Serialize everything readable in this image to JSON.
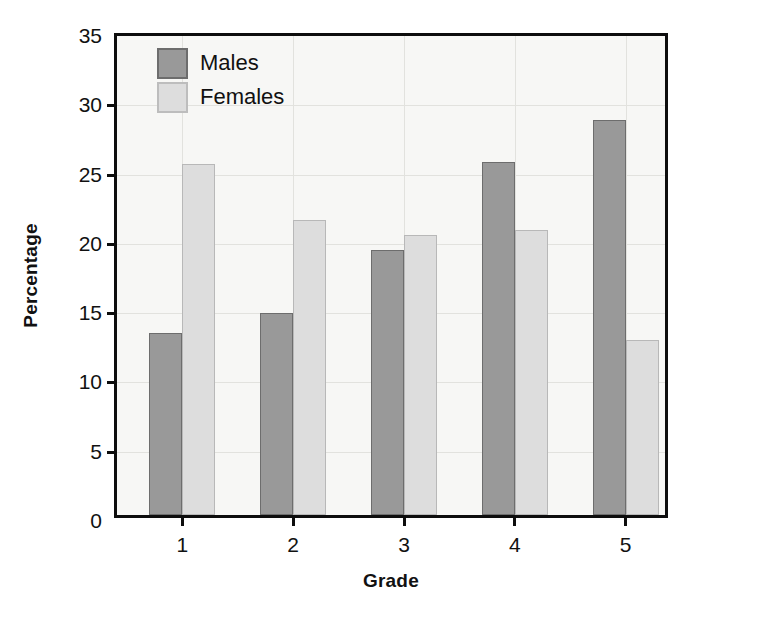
{
  "chart_data": {
    "type": "bar",
    "title": "",
    "xlabel": "Grade",
    "ylabel": "Percentage",
    "categories": [
      "1",
      "2",
      "3",
      "4",
      "5"
    ],
    "series": [
      {
        "name": "Males",
        "color": "#999999",
        "edge": "#6d6d6d",
        "values": [
          13.1,
          14.6,
          19.1,
          25.5,
          28.5
        ]
      },
      {
        "name": "Females",
        "color": "#dddddd",
        "edge": "#b8b8b8",
        "values": [
          25.3,
          21.3,
          20.2,
          20.6,
          12.6
        ]
      }
    ],
    "ylim": [
      0,
      35
    ],
    "yticks": [
      0,
      5,
      10,
      15,
      20,
      25,
      30,
      35
    ],
    "ytick_labels": [
      "0",
      "5",
      "10",
      "15",
      "20",
      "25",
      "30",
      "35"
    ],
    "grid": true,
    "legend_position": "upper left",
    "plot_background": "#f7f7f5",
    "axis_color": "#0d0d0d",
    "grid_color": "#e2e2de"
  },
  "legend": {
    "entries": [
      {
        "label": "Males"
      },
      {
        "label": "Females"
      }
    ]
  }
}
